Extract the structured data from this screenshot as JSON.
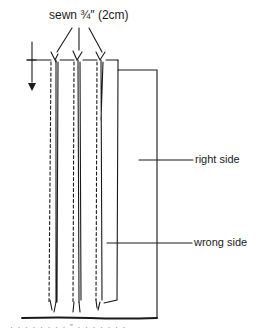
{
  "diagram": {
    "title_label": "sewn ¾″ (2cm)",
    "labels": {
      "right_side": "right side",
      "wrong_side": "wrong side"
    },
    "caption_partial": "· · · · · · · ·  ‟  · · · · · · ·",
    "colors": {
      "ink": "#1a1a1a",
      "background": "#ffffff"
    },
    "pleat_count": 3
  }
}
